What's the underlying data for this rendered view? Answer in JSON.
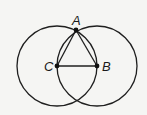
{
  "diagram": {
    "stroke_color": "#1f1f1f",
    "background": "#f5f5f3",
    "points": {
      "A": {
        "label": "A",
        "x": 76,
        "y": 30
      },
      "B": {
        "label": "B",
        "x": 97,
        "y": 66
      },
      "C": {
        "label": "C",
        "x": 57,
        "y": 66
      }
    },
    "circles": [
      {
        "center": "C",
        "radius": 40
      },
      {
        "center": "B",
        "radius": 40
      }
    ],
    "segments": [
      [
        "A",
        "B"
      ],
      [
        "A",
        "C"
      ],
      [
        "C",
        "B"
      ]
    ]
  }
}
